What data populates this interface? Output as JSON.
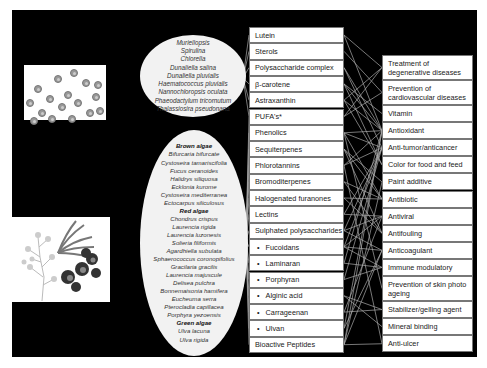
{
  "colors": {
    "background": "#000000",
    "box_fill": "#ffffff",
    "ellipse_fill": "#f2f2f2",
    "connector": "#aaaaaa"
  },
  "images": {
    "microalgae": "microalgae-cells-illustration",
    "macroalgae": "seaweed-illustration"
  },
  "microalgae": {
    "species": [
      "Muriellopsis",
      "Spirulina",
      "Chlorella",
      "Dunaliella salina",
      "Dunaliella pluvialis",
      "Haematococcus pluvialis",
      "Nannochloropsis oculata",
      "Phaeodactylum tricornutum",
      "Thalassiosira pseudonana"
    ]
  },
  "macroalgae": {
    "groups": [
      {
        "header": "Brown algae",
        "species": [
          "Bifurcaria bifurcate",
          "Cystoseira tamariscifolia",
          "Fucus ceranoides",
          "Halidrys siliquosa",
          "Ecklonia kurome",
          "Cystoseira mediterranea",
          "Ectocarpus siliculosus"
        ]
      },
      {
        "header": "Red algae",
        "species": [
          "Chondrus crispus",
          "Laurencia rigida",
          "Laurencia luzonesis",
          "Solieria filiformis",
          "Agardhiella subulata",
          "Sphaerococcus coronopifolius",
          "Gracilaria gracilis",
          "Laurencia majuscule",
          "Delisea pulchra",
          "Bonnemaisonia hamifera",
          "Eucheuma serra",
          "Pterocladia capillacea",
          "Porphyra yezoensis"
        ]
      },
      {
        "header": "Green algae",
        "species": [
          "Ulva lacuna",
          "Ulva rigida"
        ]
      }
    ]
  },
  "compounds": [
    {
      "label": "Lutein",
      "bullet": false
    },
    {
      "label": "Sterols",
      "bullet": false
    },
    {
      "label": "Polysaccharide complex",
      "bullet": false
    },
    {
      "label": "β-carotene",
      "bullet": false
    },
    {
      "label": "Astraxanthin",
      "bullet": false
    },
    {
      "label": "PUFA's*",
      "bullet": false
    },
    {
      "label": "Phenolics",
      "bullet": false
    },
    {
      "label": "Sequiterpenes",
      "bullet": false
    },
    {
      "label": "Phlorotannins",
      "bullet": false
    },
    {
      "label": "Bromoditerpenes",
      "bullet": false
    },
    {
      "label": "Halogenated furanones",
      "bullet": false
    },
    {
      "label": "Lectins",
      "bullet": false
    },
    {
      "label": "Sulphated polysaccharides",
      "bullet": false
    },
    {
      "label": "Fucoidans",
      "bullet": true
    },
    {
      "label": "Laminaran",
      "bullet": true
    },
    {
      "label": "Porphyran",
      "bullet": true
    },
    {
      "label": "Alginic acid",
      "bullet": true
    },
    {
      "label": "Carrageenan",
      "bullet": true
    },
    {
      "label": "Ulvan",
      "bullet": true
    },
    {
      "label": "Bioactive Peptides",
      "bullet": false
    }
  ],
  "applications": [
    {
      "label": "Treatment of degenerative diseases",
      "lines": 2
    },
    {
      "label": "Prevention of cardiovascular diseases",
      "lines": 2
    },
    {
      "label": "Vitamin",
      "lines": 1
    },
    {
      "label": "Antioxidant",
      "lines": 1
    },
    {
      "label": "Anti-tumor/anticancer",
      "lines": 1
    },
    {
      "label": "Color for food and feed",
      "lines": 1
    },
    {
      "label": "Paint additive",
      "lines": 1
    },
    {
      "label": "Antibiotic",
      "lines": 1
    },
    {
      "label": "Antiviral",
      "lines": 1
    },
    {
      "label": "Antifouling",
      "lines": 1
    },
    {
      "label": "Anticoagulant",
      "lines": 1
    },
    {
      "label": "Immune modulatory",
      "lines": 1
    },
    {
      "label": "Prevention of skin photo ageing",
      "lines": 2
    },
    {
      "label": "Stabilizer/gelling agent",
      "lines": 1
    },
    {
      "label": "Mineral binding",
      "lines": 1
    },
    {
      "label": "Anti-ulcer",
      "lines": 1
    }
  ]
}
